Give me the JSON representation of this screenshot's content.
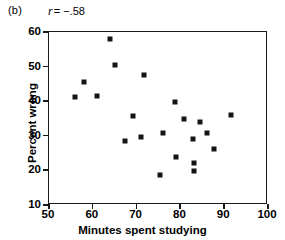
{
  "figure": {
    "panel_label": "(b)",
    "correlation_symbol": "r",
    "correlation_text": "= −.58"
  },
  "chart_data": {
    "type": "scatter",
    "title": "",
    "subtitle": "",
    "xlabel": "Minutes spent studying",
    "ylabel": "Percent wrong",
    "xlim": [
      50,
      100
    ],
    "ylim": [
      10,
      60
    ],
    "xticks": [
      50,
      60,
      70,
      80,
      90,
      100
    ],
    "yticks": [
      10,
      20,
      30,
      40,
      50,
      60
    ],
    "xtick_labels": [
      "50",
      "60",
      "70",
      "80",
      "90",
      "100"
    ],
    "ytick_labels": [
      "10",
      "20",
      "30",
      "40",
      "50",
      "60"
    ],
    "grid": false,
    "legend": "none",
    "annotations": [
      {
        "text": "(b)",
        "position": "top-left"
      },
      {
        "text": "r = −.58",
        "position": "top"
      }
    ],
    "correlation": -0.58,
    "marker": {
      "shape": "square",
      "color": "#141414",
      "size": 5
    },
    "n_points": 24,
    "points": [
      {
        "x": 56.0,
        "y": 41.2
      },
      {
        "x": 58.0,
        "y": 45.5
      },
      {
        "x": 61.0,
        "y": 41.4
      },
      {
        "x": 64.0,
        "y": 58.0
      },
      {
        "x": 65.0,
        "y": 50.4
      },
      {
        "x": 67.3,
        "y": 28.6
      },
      {
        "x": 69.2,
        "y": 35.6
      },
      {
        "x": 71.0,
        "y": 29.7
      },
      {
        "x": 71.7,
        "y": 47.7
      },
      {
        "x": 75.3,
        "y": 18.7
      },
      {
        "x": 76.0,
        "y": 30.8
      },
      {
        "x": 78.8,
        "y": 39.8
      },
      {
        "x": 78.9,
        "y": 23.9
      },
      {
        "x": 80.8,
        "y": 34.9
      },
      {
        "x": 82.8,
        "y": 29.1
      },
      {
        "x": 83.0,
        "y": 22.1
      },
      {
        "x": 83.0,
        "y": 19.9
      },
      {
        "x": 84.5,
        "y": 33.9
      },
      {
        "x": 86.0,
        "y": 30.9
      },
      {
        "x": 87.6,
        "y": 26.3
      },
      {
        "x": 91.5,
        "y": 36.0
      }
    ]
  }
}
